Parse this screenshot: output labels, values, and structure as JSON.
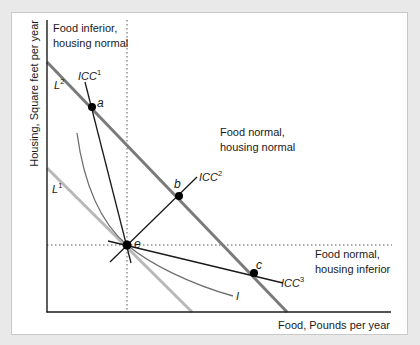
{
  "diagram": {
    "type": "consumer-choice income-consumption curves",
    "axes": {
      "x_label": "Food, Pounds per year",
      "y_label": "Housing, Square feet per year"
    },
    "regions": {
      "top_left": [
        "Food inferior,",
        "housing normal"
      ],
      "top_right": [
        "Food normal,",
        "housing normal"
      ],
      "bottom_right": [
        "Food normal,",
        "housing inferior"
      ]
    },
    "budget_lines": [
      {
        "id": "L1",
        "base": "L",
        "sup": "1",
        "color": "#b3b3b3"
      },
      {
        "id": "L2",
        "base": "L",
        "sup": "2",
        "color": "#7a7a7a"
      }
    ],
    "icc_curves": [
      {
        "id": "ICC1",
        "base": "ICC",
        "sup": "1"
      },
      {
        "id": "ICC2",
        "base": "ICC",
        "sup": "2"
      },
      {
        "id": "ICC3",
        "base": "ICC",
        "sup": "3"
      }
    ],
    "indifference_curve": {
      "label": "I"
    },
    "points": {
      "a": "a",
      "b": "b",
      "c": "c",
      "e": "e"
    },
    "colors": {
      "axis": "#1a1a1a",
      "L2": "#7a7a7a",
      "L1": "#b8b8b8",
      "icc": "#1a1a1a",
      "indifference": "#6e6e6e",
      "dotted": "#555555",
      "point": "#000000"
    }
  }
}
